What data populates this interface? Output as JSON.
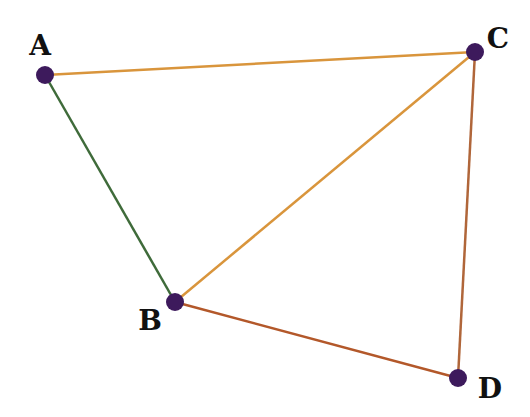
{
  "diagram": {
    "type": "graph",
    "nodes": [
      {
        "id": "A",
        "label": "A",
        "x": 45,
        "y": 75,
        "label_x": 40,
        "label_y": 55
      },
      {
        "id": "B",
        "label": "B",
        "x": 175,
        "y": 302,
        "label_x": 150,
        "label_y": 330
      },
      {
        "id": "C",
        "label": "C",
        "x": 475,
        "y": 52,
        "label_x": 498,
        "label_y": 48
      },
      {
        "id": "D",
        "label": "D",
        "x": 458,
        "y": 378,
        "label_x": 490,
        "label_y": 398
      }
    ],
    "edges": [
      {
        "from": "A",
        "to": "C",
        "color": "#d9953c"
      },
      {
        "from": "A",
        "to": "B",
        "color": "#3f6b3a"
      },
      {
        "from": "B",
        "to": "C",
        "color": "#d9953c"
      },
      {
        "from": "B",
        "to": "D",
        "color": "#b3582a"
      },
      {
        "from": "C",
        "to": "D",
        "color": "#b0663a"
      }
    ],
    "node_color": "#3d1a5c",
    "node_radius": 9
  }
}
